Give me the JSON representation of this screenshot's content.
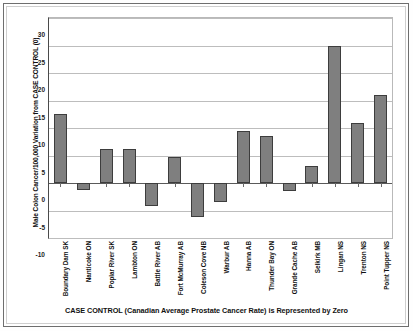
{
  "chart_data": {
    "type": "bar",
    "title": "",
    "subtitle": "",
    "xlabel": "CASE CONTROL (Canadian Average Prostate Cancer Rate) is Represented by Zero",
    "ylabel": "Male Colon Cancer/100,000 Variation from CASE CONTROL (0)",
    "ylim": [
      -10,
      30
    ],
    "yticks": [
      30,
      25,
      20,
      15,
      10,
      5,
      0,
      -5,
      -10
    ],
    "ytick_labels": [
      "30",
      "25",
      "20",
      "15",
      "10",
      "5",
      "0",
      "-5",
      "-10"
    ],
    "grid": true,
    "legend": "none",
    "bar_color": "#7f7f7f",
    "bar_border_color": "#3d3d3d",
    "zero_line_value": 0,
    "categories": [
      "Boundary Dam SK",
      "Nanticoke ON",
      "Poplar River SK",
      "Lambton ON",
      "Battle River AB",
      "Fort McMurray AB",
      "Coleson Cove NB",
      "Warbur AB",
      "Hanna AB",
      "Thunder Bay ON",
      "Grande Cache AB",
      "Selkirk MB",
      "Lingan NS",
      "Trenton NS",
      "Point Tupper NS"
    ],
    "values": [
      12.5,
      -1.2,
      6.2,
      6.1,
      -4.2,
      4.8,
      -6.2,
      -3.5,
      9.4,
      8.5,
      -1.5,
      3.1,
      25.0,
      11.0,
      16.0
    ]
  }
}
